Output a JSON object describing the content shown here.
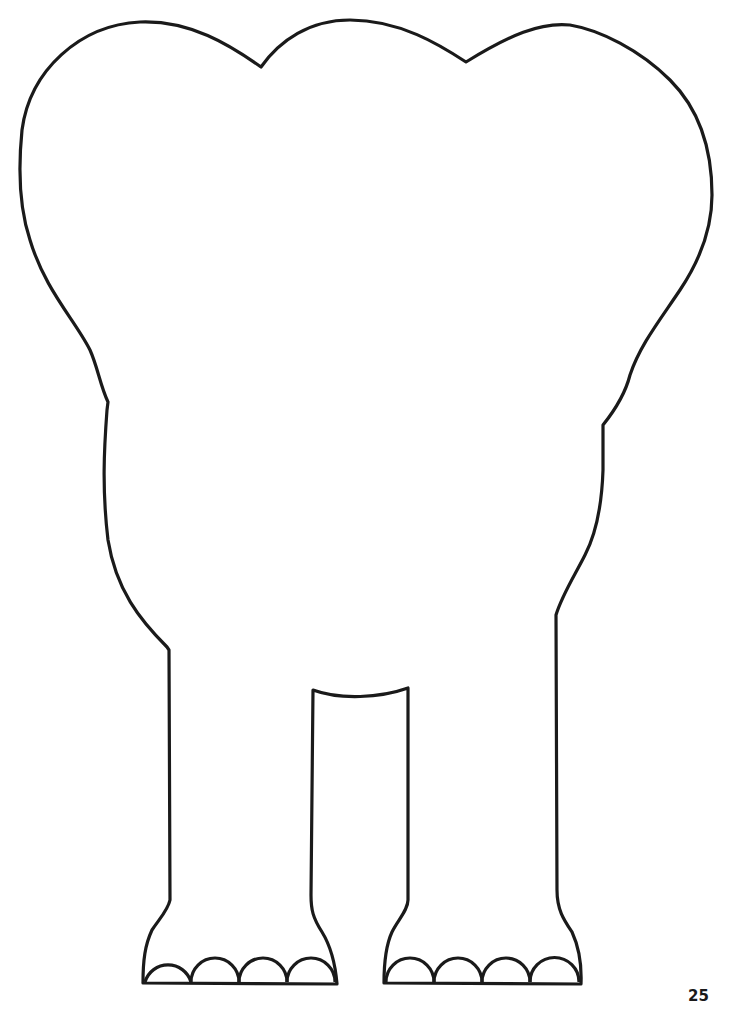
{
  "page": {
    "page_number": "25"
  },
  "figure": {
    "stroke_color": "#1a1a1a",
    "fill_color": "#ffffff",
    "toes_per_foot": 4,
    "feet": 2
  }
}
